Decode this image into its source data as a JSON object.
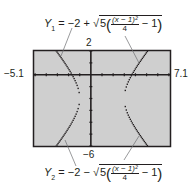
{
  "chart_data": {
    "type": "line",
    "title": "",
    "xlabel": "",
    "ylabel": "",
    "xlim": [
      -5.1,
      7.1
    ],
    "ylim": [
      -6,
      2
    ],
    "xscl": 1,
    "yscl": 1,
    "grid": false,
    "window_labels": {
      "xmin": "−5.1",
      "xmax": "7.1",
      "ymin": "−6",
      "ymax": "2"
    },
    "series": [
      {
        "name": "Y1",
        "equation": "Y1 = −2 + √(5((x − 1)²/4 − 1))",
        "domain_note": "x ≤ −1 or x ≥ 3",
        "x": [
          -5.1,
          -4,
          -3,
          -2,
          -1,
          3,
          4,
          5,
          6,
          7.1
        ],
        "values": [
          4.2,
          2.68,
          1.87,
          0.5,
          -2,
          -2,
          0.5,
          1.87,
          2.68,
          4.2
        ]
      },
      {
        "name": "Y2",
        "equation": "Y2 = −2 − √(5((x − 1)²/4 − 1))",
        "domain_note": "x ≤ −1 or x ≥ 3",
        "x": [
          -5.1,
          -4,
          -3,
          -2,
          -1,
          3,
          4,
          5,
          6,
          7.1
        ],
        "values": [
          -8.2,
          -6.68,
          -5.87,
          -4.5,
          -2,
          -2,
          -4.5,
          -5.87,
          -6.68,
          -8.2
        ]
      }
    ]
  },
  "labels": {
    "y1": {
      "name": "Y",
      "sub": "1",
      "eq": "= −2 +",
      "coef": "5",
      "num": "(x − 1)²",
      "den": "4",
      "tail": "− 1"
    },
    "y2": {
      "name": "Y",
      "sub": "2",
      "eq": "= −2 −",
      "coef": "5",
      "num": "(x − 1)²",
      "den": "4",
      "tail": "− 1"
    },
    "xmin": "−5.1",
    "xmax": "7.1",
    "ymin": "−6",
    "ymax": "2"
  },
  "colors": {
    "screen": "#cfcfcf",
    "curve": "#231f20",
    "frame": "#231f20"
  }
}
